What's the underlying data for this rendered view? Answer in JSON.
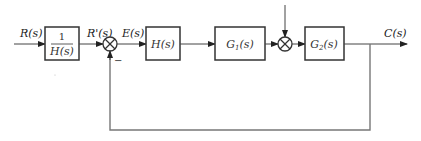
{
  "diagram": {
    "type": "control-system-block-diagram",
    "signals": {
      "input": "R(s)",
      "prefiltered": "R'(s)",
      "error": "E(s)",
      "output": "C(s)"
    },
    "blocks": {
      "prefilter": {
        "numerator": "1",
        "denominator": "H(s)"
      },
      "h": {
        "label": "H(s)"
      },
      "g1": {
        "label": "G",
        "sub": "1",
        "suffix": "(s)"
      },
      "g2": {
        "label": "G",
        "sub": "2",
        "suffix": "(s)"
      }
    },
    "summing_junctions": {
      "first": {
        "feedback_sign": "−"
      },
      "second": {
        "disturbance_input": "unlabeled arrow from top"
      }
    },
    "feedback": "unity feedback from C(s) to first summing junction",
    "colors": {
      "line": "#444444",
      "box": "#333333",
      "feedback_line": "#777777"
    }
  }
}
